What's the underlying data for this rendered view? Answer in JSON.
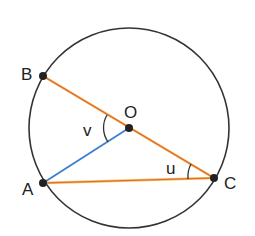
{
  "diagram": {
    "title": "",
    "circle": {
      "cx": 129,
      "cy": 128,
      "r": 100,
      "stroke": "#333333"
    },
    "points": [
      {
        "id": "B",
        "label": "B",
        "x": 43,
        "y": 76,
        "lx": 21,
        "ly": 80
      },
      {
        "id": "O",
        "label": "O",
        "x": 129,
        "y": 128,
        "lx": 124,
        "ly": 118
      },
      {
        "id": "C",
        "label": "C",
        "x": 214,
        "y": 178,
        "lx": 226,
        "ly": 189
      },
      {
        "id": "A",
        "label": "A",
        "x": 43,
        "y": 183,
        "lx": 22,
        "ly": 195
      }
    ],
    "segments": [
      {
        "from": "B",
        "to": "C",
        "color": "#e8743a",
        "name": "diameter-bc"
      },
      {
        "from": "A",
        "to": "C",
        "color": "#e8743a",
        "name": "chord-ac"
      },
      {
        "from": "A",
        "to": "O",
        "color": "#3a7fd0",
        "name": "radius-ao"
      }
    ],
    "angles": [
      {
        "label": "v",
        "vertex": "O",
        "between": [
          "B",
          "A"
        ],
        "lx": 82,
        "ly": 136
      },
      {
        "label": "u",
        "vertex": "C",
        "between": [
          "O",
          "A"
        ],
        "lx": 165,
        "ly": 173
      }
    ]
  }
}
